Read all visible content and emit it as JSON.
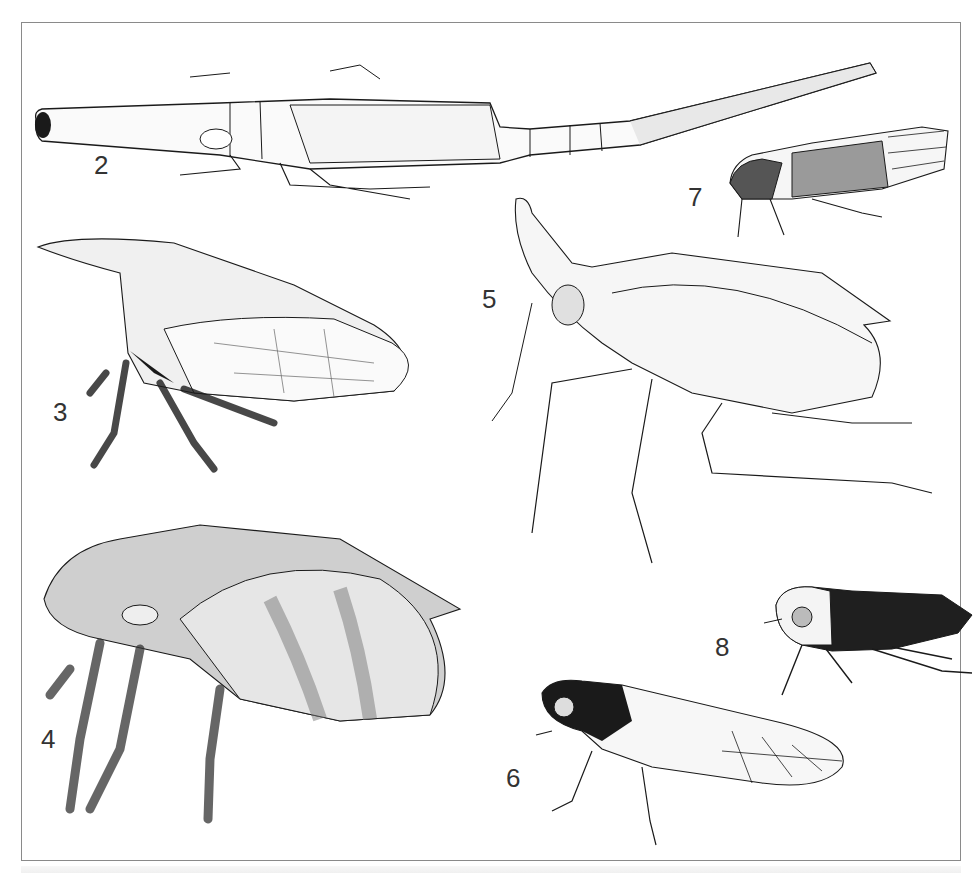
{
  "plate": {
    "description": "Plate of pen-and-stipple illustrations of hemipteran insects (planthoppers/treehoppers), figures 2–8",
    "border_color": "#8a8a8a",
    "ink_color": "#1a1a1a"
  },
  "figures": [
    {
      "number": "2",
      "subject": "elongate planthopper with long cephalic process and tapering abdomen, lateral view"
    },
    {
      "number": "3",
      "subject": "treehopper with pronotal horn, lateral view"
    },
    {
      "number": "4",
      "subject": "rounded mottled treehopper, lateral view"
    },
    {
      "number": "5",
      "subject": "planthopper with upturned cephalic horn and spined hind legs, lateral view"
    },
    {
      "number": "6",
      "subject": "leafhopper with striped head and veined forewing, lateral view"
    },
    {
      "number": "7",
      "subject": "small froghopper with veined wings, lateral view"
    },
    {
      "number": "8",
      "subject": "dark nymph with spined hind legs, lateral view"
    }
  ]
}
